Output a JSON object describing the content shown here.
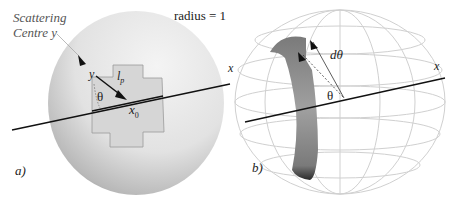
{
  "figure": {
    "panel_a": {
      "label": "a)",
      "scattering_label_line1": "Scattering",
      "scattering_label_line2": "Centre y",
      "radius_label": "radius = 1",
      "point_y": "y",
      "path_length": "l",
      "path_length_sub": "p",
      "angle": "θ",
      "point_x0": "x",
      "point_x0_sub": "0",
      "axis_label": "x"
    },
    "panel_b": {
      "label": "b)",
      "dtheta": "dθ",
      "angle": "θ",
      "axis_label": "x"
    },
    "colors": {
      "sphere_light": "#e6e6e6",
      "sphere_dark": "#8a8a8a",
      "cutout": "#d8d8d8",
      "wire": "#cfcfcf",
      "band": "#8c8c8c",
      "line": "#111111"
    }
  }
}
